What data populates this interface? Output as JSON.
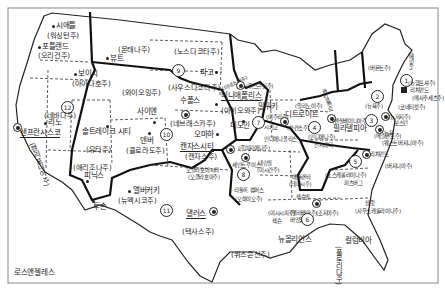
{
  "map": {
    "title": "",
    "states": [
      {
        "id": "washington",
        "label": "(워싱턴주)"
      },
      {
        "id": "oregon",
        "label": "(오리건주)"
      },
      {
        "id": "idaho",
        "label": "(아이다호주)"
      },
      {
        "id": "montana",
        "label": "(몬태나주)"
      },
      {
        "id": "wyoming",
        "label": "(와이오밍주)"
      },
      {
        "id": "nevada",
        "label": "(네바다주)"
      },
      {
        "id": "utah",
        "label": "(유타주)"
      },
      {
        "id": "california",
        "label": "(캘리포니아주)"
      },
      {
        "id": "arizona",
        "label": "(애리조나주)"
      },
      {
        "id": "colorado",
        "label": "(콜로라도주)"
      },
      {
        "id": "new-mexico",
        "label": "(뉴멕시코주)"
      },
      {
        "id": "north-dakota",
        "label": "(노스다코타주)"
      },
      {
        "id": "south-dakota",
        "label": "(사우스다코타주)"
      },
      {
        "id": "nebraska",
        "label": "(네브래스카주)"
      },
      {
        "id": "kansas",
        "label": "(캔자스주)"
      },
      {
        "id": "oklahoma",
        "label": "(오클라호마주)"
      },
      {
        "id": "texas",
        "label": "(텍사스주)"
      },
      {
        "id": "minnesota",
        "label": "(미네소타주)"
      },
      {
        "id": "iowa",
        "label": "(아이오와주)"
      },
      {
        "id": "missouri",
        "label": "(미주리주)"
      },
      {
        "id": "arkansas",
        "label": "(아칸소주)"
      },
      {
        "id": "louisiana",
        "label": "(루이지애나주)"
      },
      {
        "id": "wisconsin",
        "label": "(위스콘신주)"
      },
      {
        "id": "illinois",
        "label": "(일리노이주)"
      },
      {
        "id": "indiana",
        "label": "(인디애나주)"
      },
      {
        "id": "michigan",
        "label": "(미시간주)"
      },
      {
        "id": "ohio",
        "label": "(오하이오주)"
      },
      {
        "id": "kentucky",
        "label": "(켄터키주)"
      },
      {
        "id": "tennessee",
        "label": "(테네시주)"
      },
      {
        "id": "mississippi",
        "label": "(미시시피주)"
      },
      {
        "id": "alabama",
        "label": "(앨라배마주)"
      },
      {
        "id": "georgia",
        "label": "(조지아주)"
      },
      {
        "id": "florida",
        "label": "(플로리다주)"
      },
      {
        "id": "south-carolina",
        "label": "(사우스캐롤라이나주)"
      },
      {
        "id": "north-carolina",
        "label": "(노스캐롤라이나주)"
      },
      {
        "id": "virginia",
        "label": "(버지니아주)"
      },
      {
        "id": "west-virginia",
        "label": "(웨스트버지니아주)"
      },
      {
        "id": "pennsylvania",
        "label": "(펜실베이니아주)"
      },
      {
        "id": "new-york",
        "label": "(뉴욕주)"
      },
      {
        "id": "vermont",
        "label": "(버몬트주)"
      },
      {
        "id": "maine",
        "label": "(메인주)"
      },
      {
        "id": "new-hampshire",
        "label": "(뉴햄프셔주)"
      },
      {
        "id": "massachusetts",
        "label": "(매사추세츠주)"
      },
      {
        "id": "connecticut",
        "label": "(코네티컷주)"
      },
      {
        "id": "new-jersey",
        "label": "(뉴저지주)"
      },
      {
        "id": "delaware",
        "label": "(델라웨어주)"
      },
      {
        "id": "maryland",
        "label": "(메릴랜드주)"
      }
    ],
    "cities": [
      {
        "id": "seattle",
        "label": "시애틀"
      },
      {
        "id": "portland",
        "label": "포틀랜드"
      },
      {
        "id": "boise",
        "label": "보이시"
      },
      {
        "id": "butte",
        "label": "뷰트"
      },
      {
        "id": "reno",
        "label": "리노"
      },
      {
        "id": "san-francisco",
        "label": "샌프란시스코"
      },
      {
        "id": "salt-lake-city",
        "label": "솔트레이크 시티"
      },
      {
        "id": "cheyenne",
        "label": "사이엔"
      },
      {
        "id": "denver",
        "label": "덴버"
      },
      {
        "id": "phoenix",
        "label": "피닉스"
      },
      {
        "id": "los-angeles",
        "label": "로스앤젤레스"
      },
      {
        "id": "albuquerque",
        "label": "앨버커키"
      },
      {
        "id": "tucson",
        "label": "투손"
      },
      {
        "id": "fargo",
        "label": "파고"
      },
      {
        "id": "sioux-falls",
        "label": "수폴스"
      },
      {
        "id": "omaha",
        "label": "오마하"
      },
      {
        "id": "kansas-city",
        "label": "캔자스시티"
      },
      {
        "id": "oklahoma-city",
        "label": "오클라호마시티"
      },
      {
        "id": "dallas",
        "label": "댈러스"
      },
      {
        "id": "minneapolis",
        "label": "미니애폴리스"
      },
      {
        "id": "des-moines",
        "label": "디모인"
      },
      {
        "id": "milwaukee",
        "label": "밀워키"
      },
      {
        "id": "chicago",
        "label": "시카고"
      },
      {
        "id": "indianapolis",
        "label": "인디애나폴리스"
      },
      {
        "id": "st-louis",
        "label": "세인트루이스"
      },
      {
        "id": "little-rock",
        "label": "리틀록 캠퍼스"
      },
      {
        "id": "new-orleans",
        "label": "뉴올리언스"
      },
      {
        "id": "detroit",
        "label": "디트로이트"
      },
      {
        "id": "cincinnati",
        "label": "신시내티"
      },
      {
        "id": "louisville",
        "label": "루이빌"
      },
      {
        "id": "nashville",
        "label": "내슈빌"
      },
      {
        "id": "atlanta",
        "label": "애틀랜타"
      },
      {
        "id": "jacksonville",
        "label": "잭슨빌"
      },
      {
        "id": "columbia",
        "label": "컬럼비아"
      },
      {
        "id": "charlotte",
        "label": "샬럿"
      },
      {
        "id": "pittsburgh",
        "label": "피츠버그"
      },
      {
        "id": "philadelphia",
        "label": "필라델피아"
      },
      {
        "id": "new-york-city",
        "label": "뉴욕"
      },
      {
        "id": "boston",
        "label": "보스턴"
      },
      {
        "id": "richmond",
        "label": "리치먼드"
      },
      {
        "id": "birmingham",
        "label": "버밍엄"
      }
    ],
    "districts": [
      "1",
      "2",
      "3",
      "4",
      "5",
      "6",
      "7",
      "8",
      "9",
      "10",
      "11",
      "12"
    ]
  }
}
